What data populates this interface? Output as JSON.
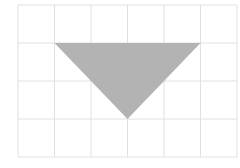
{
  "diagram": {
    "type": "grid-with-shape",
    "grid": {
      "columns": 6,
      "rows": 4,
      "x0": 18,
      "y0": 5,
      "cell_width": 36.5,
      "cell_height": 38,
      "line_color": "#e0e0e0"
    },
    "shape": {
      "kind": "triangle",
      "orientation": "downward",
      "vertices_grid": [
        [
          1,
          1
        ],
        [
          5,
          1
        ],
        [
          3,
          3
        ]
      ],
      "fill_color": "#b3b3b3"
    }
  }
}
